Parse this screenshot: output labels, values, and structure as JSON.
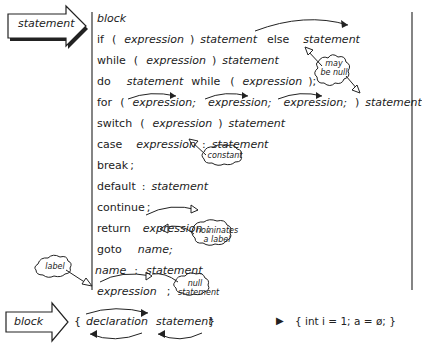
{
  "main_arrow": {
    "label": "statement"
  },
  "rows": [
    {
      "parts": [
        "block"
      ],
      "styles": [
        "it"
      ]
    },
    {
      "parts": [
        "if",
        "(",
        "expression",
        ")",
        "statement",
        "else",
        "statement"
      ],
      "styles": [
        "kw",
        "punct",
        "it",
        "punct",
        "it",
        "kw",
        "it"
      ]
    },
    {
      "parts": [
        "while",
        "(",
        "expression",
        ")",
        "statement"
      ],
      "styles": [
        "kw",
        "punct",
        "it",
        "punct",
        "it"
      ]
    },
    {
      "parts": [
        "do",
        "statement",
        "while",
        "(",
        "expression",
        ");"
      ],
      "styles": [
        "kw",
        "it",
        "kw",
        "punct",
        "it",
        "punct"
      ]
    },
    {
      "parts": [
        "for",
        "(",
        "expression;",
        "expression;",
        "expression;",
        ")",
        "statement"
      ],
      "styles": [
        "kw",
        "punct",
        "it",
        "it",
        "it",
        "punct",
        "it"
      ]
    },
    {
      "parts": [
        "switch",
        "(",
        "expression",
        ")",
        "statement"
      ],
      "styles": [
        "kw",
        "punct",
        "it",
        "punct",
        "it"
      ]
    },
    {
      "parts": [
        "case",
        "expression",
        ":",
        "statement"
      ],
      "styles": [
        "kw",
        "it",
        "punct",
        "it"
      ]
    },
    {
      "parts": [
        "break",
        ";"
      ],
      "styles": [
        "kw",
        "punct"
      ]
    },
    {
      "parts": [
        "default",
        ":",
        "statement"
      ],
      "styles": [
        "kw",
        "punct",
        "it"
      ]
    },
    {
      "parts": [
        "continue",
        ";"
      ],
      "styles": [
        "kw",
        "punct"
      ]
    },
    {
      "parts": [
        "return",
        "expression",
        ";"
      ],
      "styles": [
        "kw",
        "it",
        "punct"
      ]
    },
    {
      "parts": [
        "goto",
        "name;"
      ],
      "styles": [
        "kw",
        "it"
      ]
    },
    {
      "parts": [
        "name",
        ":",
        "statement"
      ],
      "styles": [
        "it",
        "punct",
        "it"
      ]
    },
    {
      "parts": [
        "expression",
        ";"
      ],
      "styles": [
        "it",
        "punct"
      ]
    }
  ],
  "annotations": {
    "may_be_null": [
      "may",
      "be null"
    ],
    "constant": "constant",
    "nominates_a_label": [
      "nominates",
      "a label"
    ],
    "label": "label",
    "null_statement": [
      "null",
      "statement"
    ]
  },
  "block_arrow": {
    "label": "block",
    "open_brace": "{",
    "declaration": "declaration",
    "statement": "statement",
    "close_brace": "}"
  },
  "example": {
    "marker": "▶",
    "code": "{ int i = 1; a = ø; }"
  }
}
